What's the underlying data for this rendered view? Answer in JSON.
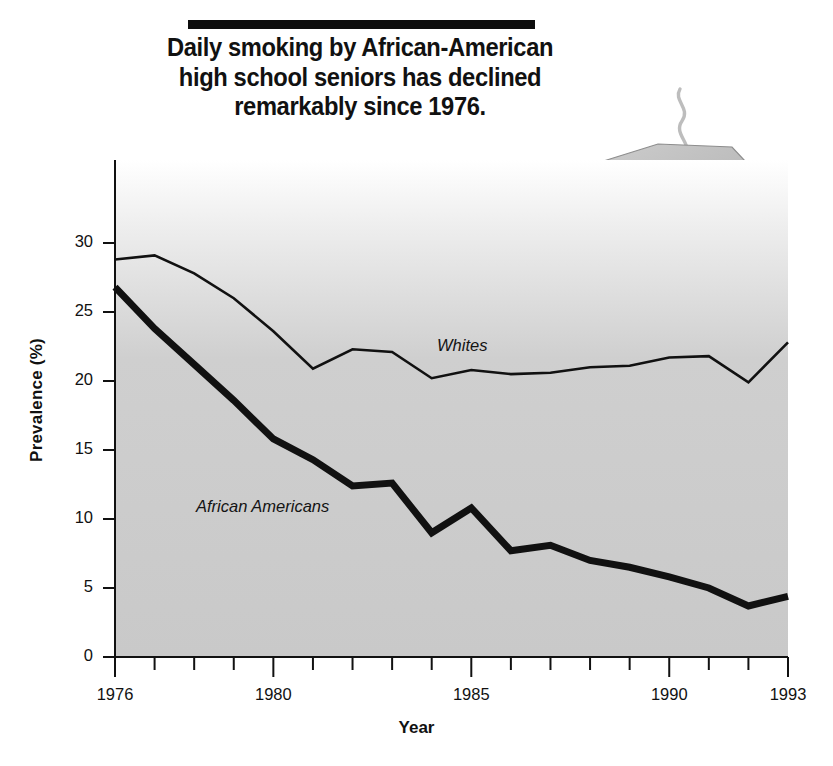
{
  "title": {
    "text": "Daily smoking by African-American\nhigh school seniors has declined\nremarkably since 1976."
  },
  "illustration": {
    "name": "ashtray-with-cigarette",
    "description": "Grey octagonal ashtray holding a lit cigarette with a wavy smoke trail"
  },
  "axis": {
    "y_title": "Prevalence (%)",
    "x_title": "Year"
  },
  "series_labels": {
    "whites": "Whites",
    "african_americans": "African Americans"
  },
  "colors": {
    "line": "#111111",
    "plot_background_top": "#ffffff",
    "plot_background_bottom": "#c9c9c9",
    "text": "#111111",
    "title_rule": "#0d0d0d"
  },
  "chart_data": {
    "type": "line",
    "title": "Daily smoking by African-American high school seniors has declined remarkably since 1976.",
    "xlabel": "Year",
    "ylabel": "Prevalence (%)",
    "xlim": [
      1976,
      1993
    ],
    "ylim": [
      0,
      30
    ],
    "ytick_labels": [
      "0",
      "5",
      "10",
      "15",
      "20",
      "25",
      "30"
    ],
    "yticks": [
      0,
      5,
      10,
      15,
      20,
      25,
      30
    ],
    "xtick_labels": [
      "1976",
      "1980",
      "1985",
      "1990",
      "1993"
    ],
    "xticks_major": [
      1976,
      1980,
      1985,
      1990,
      1993
    ],
    "xticks_all": [
      1976,
      1977,
      1978,
      1979,
      1980,
      1981,
      1982,
      1983,
      1984,
      1985,
      1986,
      1987,
      1988,
      1989,
      1990,
      1991,
      1992,
      1993
    ],
    "grid": false,
    "legend": "inline-annotations",
    "x": [
      1976,
      1977,
      1978,
      1979,
      1980,
      1981,
      1982,
      1983,
      1984,
      1985,
      1986,
      1987,
      1988,
      1989,
      1990,
      1991,
      1992,
      1993
    ],
    "series": [
      {
        "name": "Whites",
        "style": "thin",
        "values": [
          28.8,
          29.1,
          27.8,
          26.0,
          23.6,
          20.9,
          22.3,
          22.1,
          20.2,
          20.8,
          20.5,
          20.6,
          21.0,
          21.1,
          21.7,
          21.8,
          19.9,
          22.8
        ]
      },
      {
        "name": "African Americans",
        "style": "thick",
        "values": [
          26.8,
          23.8,
          21.2,
          18.6,
          15.8,
          14.3,
          12.4,
          12.6,
          9.0,
          10.8,
          7.7,
          8.1,
          7.0,
          6.5,
          5.8,
          5.0,
          3.7,
          4.4
        ]
      }
    ]
  }
}
